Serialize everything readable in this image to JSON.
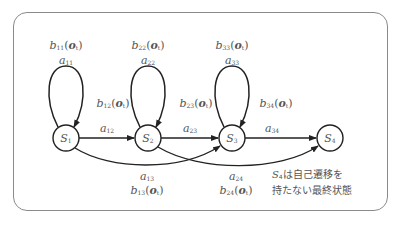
{
  "diagram": {
    "type": "hmm-left-to-right",
    "states": [
      {
        "id": "S1",
        "name": "S",
        "sub": "1",
        "cx": 66,
        "cy": 138
      },
      {
        "id": "S2",
        "name": "S",
        "sub": "2",
        "cx": 148,
        "cy": 138
      },
      {
        "id": "S3",
        "name": "S",
        "sub": "3",
        "cx": 232,
        "cy": 138
      },
      {
        "id": "S4",
        "name": "S",
        "sub": "4",
        "cx": 330,
        "cy": 138
      }
    ],
    "self_loops": [
      {
        "state": "S1",
        "a": {
          "sym": "a",
          "sub": "11"
        },
        "b": {
          "sym": "b",
          "sub": "11",
          "arg": "o",
          "arg_sub": "t"
        }
      },
      {
        "state": "S2",
        "a": {
          "sym": "a",
          "sub": "22"
        },
        "b": {
          "sym": "b",
          "sub": "22",
          "arg": "o",
          "arg_sub": "t"
        }
      },
      {
        "state": "S3",
        "a": {
          "sym": "a",
          "sub": "33"
        },
        "b": {
          "sym": "b",
          "sub": "33",
          "arg": "o",
          "arg_sub": "t"
        }
      }
    ],
    "side_output_labels": [
      {
        "sym": "b",
        "sub": "12",
        "arg": "o",
        "arg_sub": "t"
      },
      {
        "sym": "b",
        "sub": "23",
        "arg": "o",
        "arg_sub": "t"
      },
      {
        "sym": "b",
        "sub": "34",
        "arg": "o",
        "arg_sub": "t"
      }
    ],
    "forward_edges": [
      {
        "from": "S1",
        "to": "S2",
        "a": {
          "sym": "a",
          "sub": "12"
        }
      },
      {
        "from": "S2",
        "to": "S3",
        "a": {
          "sym": "a",
          "sub": "23"
        }
      },
      {
        "from": "S3",
        "to": "S4",
        "a": {
          "sym": "a",
          "sub": "34"
        }
      }
    ],
    "skip_edges": [
      {
        "from": "S1",
        "to": "S3",
        "a": {
          "sym": "a",
          "sub": "13"
        },
        "b": {
          "sym": "b",
          "sub": "13",
          "arg": "o",
          "arg_sub": "t"
        }
      },
      {
        "from": "S2",
        "to": "S4",
        "a": {
          "sym": "a",
          "sub": "24"
        },
        "b": {
          "sym": "b",
          "sub": "24",
          "arg": "o",
          "arg_sub": "t"
        }
      }
    ],
    "note": {
      "state_sym": "S",
      "state_sub": "4",
      "line1_rest": "は自己遷移を",
      "line2": "持たない最終状態"
    },
    "colors": {
      "stroke": "#222222",
      "label": "#555555",
      "frame": "#8a8a8a"
    }
  }
}
